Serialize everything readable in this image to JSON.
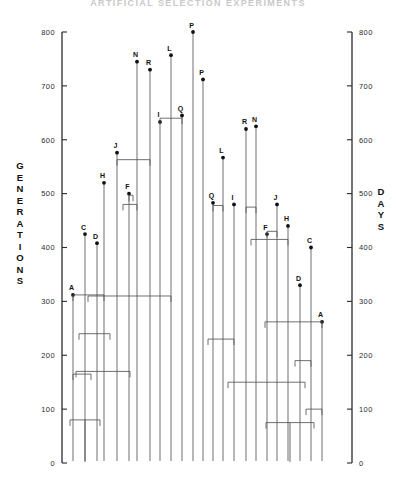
{
  "title": "ARTIFICIAL SELECTION EXPERIMENTS",
  "axes": {
    "left": {
      "name": "GENERATIONS",
      "min": 0,
      "max": 800,
      "step": 100,
      "ticks": [
        "0",
        "100",
        "200",
        "300",
        "400",
        "500",
        "600",
        "700",
        "800"
      ]
    },
    "right": {
      "name": "DAYS",
      "min": 0,
      "max": 800,
      "step": 100,
      "ticks": [
        "0",
        "100",
        "200",
        "300",
        "400",
        "500",
        "600",
        "700",
        "800"
      ]
    }
  },
  "chart_data": {
    "type": "line",
    "subtype": "dendrogram",
    "title": "ARTIFICIAL SELECTION EXPERIMENTS",
    "xlabel": "",
    "ylabel": "GENERATIONS",
    "ylabel_right": "DAYS",
    "ylim": [
      0,
      800
    ],
    "grid": false,
    "legend": null,
    "annotations": [
      "Two mirrored hierarchical cluster trees (left axis GENERATIONS, right axis DAYS).",
      "Leaf tips are marked with filled dots and lettered labels."
    ],
    "clusters": [
      {
        "name": "generations-tree",
        "leaves": [
          {
            "label": "A",
            "x": 73,
            "value": 312
          },
          {
            "label": "C",
            "x": 85,
            "value": 425
          },
          {
            "label": "D",
            "x": 97,
            "value": 408
          },
          {
            "label": "H",
            "x": 104,
            "value": 520
          },
          {
            "label": "J",
            "x": 117,
            "value": 576
          },
          {
            "label": "F",
            "x": 129,
            "value": 500
          },
          {
            "label": "N",
            "x": 137,
            "value": 745
          },
          {
            "label": "R",
            "x": 150,
            "value": 730
          },
          {
            "label": "I",
            "x": 160,
            "value": 633
          },
          {
            "label": "L",
            "x": 171,
            "value": 757
          },
          {
            "label": "Q",
            "x": 182,
            "value": 645
          },
          {
            "label": "P",
            "x": 193,
            "value": 800
          }
        ],
        "merges": [
          {
            "height": 640,
            "left_x": 160,
            "right_x": 182
          },
          {
            "height": 563,
            "left_x": 117,
            "right_x": 150
          },
          {
            "height": 497,
            "left_x": 129,
            "right_x": 133
          },
          {
            "height": 480,
            "left_x": 123,
            "right_x": 137
          },
          {
            "height": 312,
            "left_x": 73,
            "right_x": 104
          },
          {
            "height": 310,
            "left_x": 88,
            "right_x": 171
          },
          {
            "height": 240,
            "left_x": 79,
            "right_x": 110
          },
          {
            "height": 170,
            "left_x": 76,
            "right_x": 130
          },
          {
            "height": 165,
            "left_x": 73,
            "right_x": 91
          },
          {
            "height": 80,
            "left_x": 70,
            "right_x": 100
          }
        ]
      },
      {
        "name": "days-tree",
        "leaves": [
          {
            "label": "P",
            "x": 203,
            "value": 712
          },
          {
            "label": "Q",
            "x": 213,
            "value": 483
          },
          {
            "label": "L",
            "x": 223,
            "value": 567
          },
          {
            "label": "I",
            "x": 234,
            "value": 480
          },
          {
            "label": "R",
            "x": 246,
            "value": 620
          },
          {
            "label": "N",
            "x": 256,
            "value": 625
          },
          {
            "label": "J",
            "x": 277,
            "value": 480
          },
          {
            "label": "F",
            "x": 267,
            "value": 425
          },
          {
            "label": "H",
            "x": 288,
            "value": 440
          },
          {
            "label": "D",
            "x": 300,
            "value": 330
          },
          {
            "label": "C",
            "x": 311,
            "value": 400
          },
          {
            "label": "A",
            "x": 322,
            "value": 262
          }
        ],
        "merges": [
          {
            "height": 478,
            "left_x": 213,
            "right_x": 223
          },
          {
            "height": 475,
            "left_x": 246,
            "right_x": 256
          },
          {
            "height": 430,
            "left_x": 267,
            "right_x": 277
          },
          {
            "height": 415,
            "left_x": 251,
            "right_x": 288
          },
          {
            "height": 262,
            "left_x": 265,
            "right_x": 322
          },
          {
            "height": 230,
            "left_x": 208,
            "right_x": 234
          },
          {
            "height": 190,
            "left_x": 295,
            "right_x": 311
          },
          {
            "height": 150,
            "left_x": 228,
            "right_x": 305
          },
          {
            "height": 100,
            "left_x": 306,
            "right_x": 322
          },
          {
            "height": 75,
            "left_x": 266,
            "right_x": 314
          }
        ]
      }
    ]
  }
}
